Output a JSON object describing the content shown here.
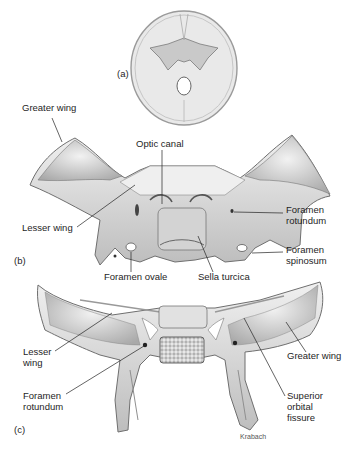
{
  "figure": {
    "panels": [
      {
        "id": "a",
        "label": "(a)"
      },
      {
        "id": "b",
        "label": "(b)"
      },
      {
        "id": "c",
        "label": "(c)"
      }
    ],
    "labels_b": {
      "greater_wing": "Greater wing",
      "optic_canal": "Optic canal",
      "lesser_wing": "Lesser wing",
      "foramen_rotundum": "Foramen\nrotundum",
      "foramen_spinosum": "Foramen\nspinosum",
      "foramen_ovale": "Foramen ovale",
      "sella_turcica": "Sella turcica"
    },
    "labels_c": {
      "lesser_wing": "Lesser\nwing",
      "foramen_rotundum": "Foramen\nrotundum",
      "greater_wing": "Greater wing",
      "superior_orbital_fissure": "Superior\norbital\nfissure"
    },
    "credit": "Krabach",
    "colors": {
      "bone_light": "#e6e6e6",
      "bone_mid": "#c8c8c8",
      "bone_dark": "#8a8a8a",
      "outline": "#6a6a6a",
      "leader": "#222222"
    }
  }
}
